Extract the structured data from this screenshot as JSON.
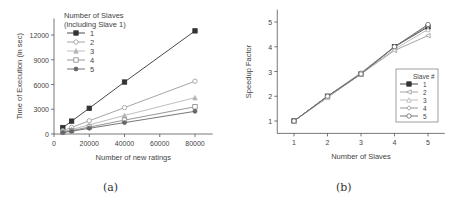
{
  "captions": {
    "a": "(a)",
    "b": "(b)"
  },
  "chart_data": [
    {
      "id": "a",
      "type": "line",
      "title": "",
      "xlabel": "Number of new ratings",
      "ylabel": "Time of Execution (in sec)",
      "xlim": [
        0,
        90000
      ],
      "ylim": [
        0,
        14000
      ],
      "xticks": [
        0,
        20000,
        40000,
        60000,
        80000
      ],
      "yticks": [
        0,
        3000,
        6000,
        9000,
        12000
      ],
      "grid": false,
      "legend": {
        "title": "Number of Slaves\n(including Slave 1)",
        "title_lines": [
          "Number of Slaves",
          "(including Slave 1)"
        ],
        "position": "upper left"
      },
      "x": [
        5000,
        10000,
        20000,
        40000,
        80000
      ],
      "series": [
        {
          "name": "1",
          "marker": "filled-square",
          "values": [
            780,
            1560,
            3120,
            6300,
            12500
          ]
        },
        {
          "name": "2",
          "marker": "open-circle",
          "values": [
            400,
            800,
            1600,
            3200,
            6400
          ]
        },
        {
          "name": "3",
          "marker": "filled-triangle",
          "values": [
            270,
            550,
            1100,
            2250,
            4400
          ]
        },
        {
          "name": "4",
          "marker": "open-square",
          "values": [
            210,
            420,
            840,
            1680,
            3300
          ]
        },
        {
          "name": "5",
          "marker": "filled-star",
          "values": [
            170,
            340,
            690,
            1380,
            2750
          ]
        }
      ]
    },
    {
      "id": "b",
      "type": "line",
      "title": "",
      "xlabel": "Number of Slaves",
      "ylabel": "Speedup Factor",
      "xlim": [
        0.5,
        5.5
      ],
      "ylim": [
        0.5,
        5.5
      ],
      "xticks": [
        1,
        2,
        3,
        4,
        5
      ],
      "yticks": [
        1,
        2,
        3,
        4,
        5
      ],
      "grid": false,
      "legend": {
        "title": "Slave #",
        "title_lines": [
          "Slave #"
        ],
        "position": "lower right"
      },
      "x": [
        1,
        2,
        3,
        4,
        5
      ],
      "series": [
        {
          "name": "1",
          "marker": "filled-square",
          "values": [
            1,
            2.0,
            2.9,
            4.0,
            4.8
          ]
        },
        {
          "name": "2",
          "marker": "open-triangle-left",
          "values": [
            1,
            1.95,
            2.9,
            3.85,
            4.45
          ]
        },
        {
          "name": "3",
          "marker": "open-triangle",
          "values": [
            1,
            1.95,
            2.9,
            3.9,
            4.7
          ]
        },
        {
          "name": "4",
          "marker": "open-diamond",
          "values": [
            1,
            2.0,
            2.95,
            4.0,
            4.85
          ]
        },
        {
          "name": "5",
          "marker": "open-circle",
          "values": [
            1,
            2.0,
            2.9,
            4.0,
            4.9
          ]
        }
      ]
    }
  ],
  "colors": {
    "axis": "#555555",
    "series_1": "#333333",
    "series_2": "#9a9a9a",
    "series_3": "#b5b5b5",
    "series_4": "#8a8a8a",
    "series_5": "#666666"
  }
}
